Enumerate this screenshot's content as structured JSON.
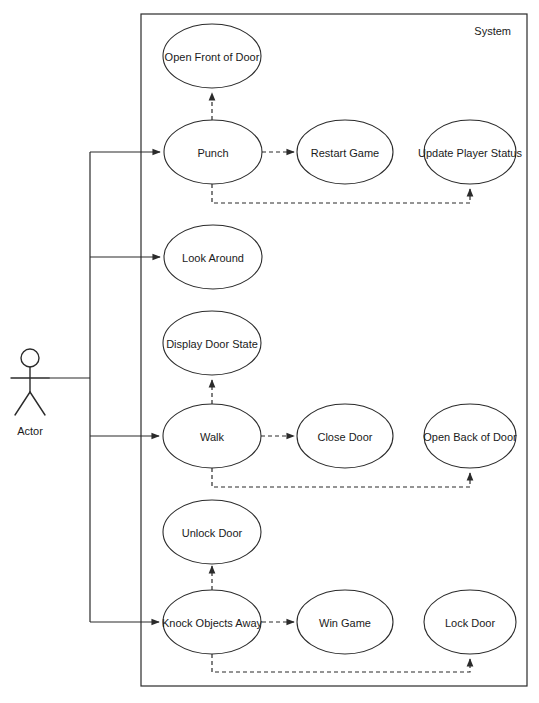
{
  "diagram": {
    "type": "uml-use-case-diagram",
    "system_boundary_label": "System",
    "actor": {
      "name": "Actor",
      "icon": "stick-figure-icon"
    },
    "colors": {
      "background": "#ffffff",
      "stroke": "#2b2b2b",
      "text": "#1a1a1a",
      "ellipse_fill": "#ffffff"
    },
    "use_cases": [
      {
        "id": "open-front-of-door",
        "label": "Open Front of Door",
        "cx": 212,
        "cy": 56
      },
      {
        "id": "punch",
        "label": "Punch",
        "cx": 213,
        "cy": 152
      },
      {
        "id": "restart-game",
        "label": "Restart Game",
        "cx": 345,
        "cy": 152
      },
      {
        "id": "update-player-status",
        "label": "Update Player Status",
        "cx": 470,
        "cy": 152
      },
      {
        "id": "look-around",
        "label": "Look Around",
        "cx": 213,
        "cy": 257
      },
      {
        "id": "display-door-state",
        "label": "Display Door State",
        "cx": 212,
        "cy": 343
      },
      {
        "id": "walk",
        "label": "Walk",
        "cx": 212,
        "cy": 436
      },
      {
        "id": "close-door",
        "label": "Close Door",
        "cx": 345,
        "cy": 436
      },
      {
        "id": "open-back-of-door",
        "label": "Open Back of Door",
        "cx": 470,
        "cy": 436
      },
      {
        "id": "unlock-door",
        "label": "Unlock Door",
        "cx": 212,
        "cy": 532
      },
      {
        "id": "knock-objects-away",
        "label": "Knock Objects Away",
        "cx": 212,
        "cy": 622
      },
      {
        "id": "win-game",
        "label": "Win Game",
        "cx": 345,
        "cy": 622
      },
      {
        "id": "lock-door",
        "label": "Lock Door",
        "cx": 470,
        "cy": 622
      }
    ],
    "associations": [
      {
        "from": "actor",
        "to": "punch",
        "style": "solid"
      },
      {
        "from": "actor",
        "to": "look-around",
        "style": "solid"
      },
      {
        "from": "actor",
        "to": "walk",
        "style": "solid"
      },
      {
        "from": "actor",
        "to": "knock-objects-away",
        "style": "solid"
      }
    ],
    "dependencies": [
      {
        "from": "punch",
        "to": "open-front-of-door",
        "style": "dashed"
      },
      {
        "from": "punch",
        "to": "restart-game",
        "style": "dashed"
      },
      {
        "from": "punch",
        "to": "update-player-status",
        "style": "dashed"
      },
      {
        "from": "walk",
        "to": "display-door-state",
        "style": "dashed"
      },
      {
        "from": "walk",
        "to": "close-door",
        "style": "dashed"
      },
      {
        "from": "walk",
        "to": "open-back-of-door",
        "style": "dashed"
      },
      {
        "from": "knock-objects-away",
        "to": "unlock-door",
        "style": "dashed"
      },
      {
        "from": "knock-objects-away",
        "to": "win-game",
        "style": "dashed"
      },
      {
        "from": "knock-objects-away",
        "to": "lock-door",
        "style": "dashed"
      }
    ]
  }
}
